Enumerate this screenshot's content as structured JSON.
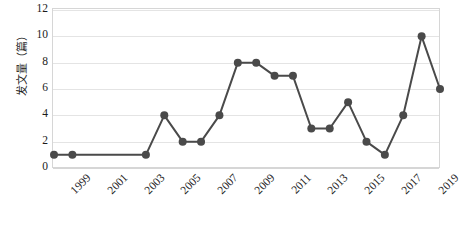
{
  "chart_data": {
    "type": "line",
    "title": "",
    "subtitle": "",
    "xlabel": "",
    "ylabel": "发文量（篇）",
    "ylim": [
      0,
      12
    ],
    "ytick_values": [
      0,
      2,
      4,
      6,
      8,
      10,
      12
    ],
    "ytick_labels": [
      "0",
      "2",
      "4",
      "6",
      "8",
      "10",
      "12"
    ],
    "xlim": [
      1999,
      2020
    ],
    "x": [
      1999,
      2000,
      2001,
      2002,
      2003,
      2004,
      2005,
      2006,
      2007,
      2008,
      2009,
      2010,
      2011,
      2012,
      2013,
      2014,
      2015,
      2016,
      2017,
      2018,
      2019,
      2020
    ],
    "values": [
      1,
      1,
      1,
      1,
      1,
      1,
      4,
      2,
      2,
      4,
      8,
      8,
      7,
      7,
      3,
      3,
      5,
      2,
      1,
      4,
      10,
      6
    ],
    "xtick_labels": [
      "1999",
      "2001",
      "2003",
      "2005",
      "2007",
      "2009",
      "2011",
      "2013",
      "2015",
      "2017",
      "2019"
    ],
    "xtick_values": [
      1999,
      2001,
      2003,
      2005,
      2007,
      2009,
      2011,
      2013,
      2015,
      2017,
      2019
    ],
    "marker_x": [
      1999,
      2000,
      2004,
      2005,
      2006,
      2007,
      2008,
      2009,
      2010,
      2011,
      2012,
      2013,
      2014,
      2015,
      2016,
      2017,
      2018,
      2019,
      2020
    ],
    "series_color": "#4a4a4a",
    "grid_color": "#e4e4e4",
    "border_color": "#d6d6d6",
    "background_color": "#ffffff",
    "grid": true,
    "grid_axis": "y",
    "legend": false,
    "legend_position": "none",
    "line_width": 2,
    "marker": "circle",
    "marker_size": 4
  }
}
